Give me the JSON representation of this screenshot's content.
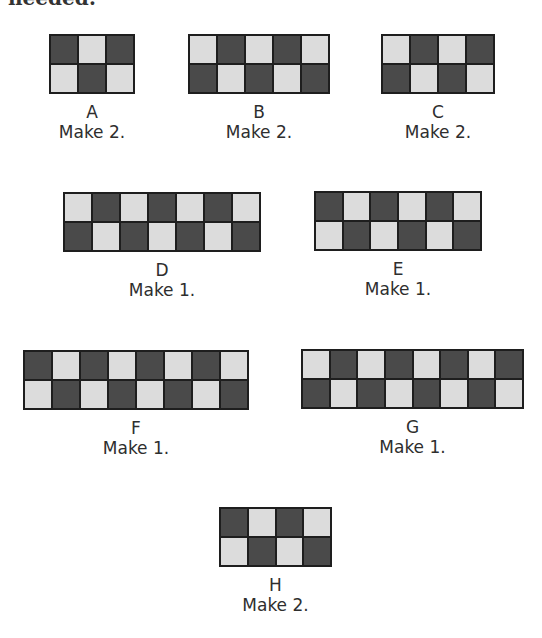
{
  "heading": "needed:",
  "colors": {
    "dark": "#4a4a4a",
    "light": "#dcdcdc",
    "border": "#1e1e1e"
  },
  "units": [
    {
      "letter": "A",
      "instruction": "Make 2.",
      "columns": 3,
      "rows": 2,
      "pattern": [
        [
          "dark",
          "light",
          "dark"
        ],
        [
          "light",
          "dark",
          "light"
        ]
      ],
      "box": {
        "x": 49,
        "y": 34,
        "w": 86,
        "h": 60
      }
    },
    {
      "letter": "B",
      "instruction": "Make 2.",
      "columns": 5,
      "rows": 2,
      "pattern": [
        [
          "light",
          "dark",
          "light",
          "dark",
          "light"
        ],
        [
          "dark",
          "light",
          "dark",
          "light",
          "dark"
        ]
      ],
      "box": {
        "x": 188,
        "y": 34,
        "w": 142,
        "h": 60
      }
    },
    {
      "letter": "C",
      "instruction": "Make 2.",
      "columns": 4,
      "rows": 2,
      "pattern": [
        [
          "light",
          "dark",
          "light",
          "dark"
        ],
        [
          "dark",
          "light",
          "dark",
          "light"
        ]
      ],
      "box": {
        "x": 381,
        "y": 34,
        "w": 114,
        "h": 60
      }
    },
    {
      "letter": "D",
      "instruction": "Make 1.",
      "columns": 7,
      "rows": 2,
      "pattern": [
        [
          "light",
          "dark",
          "light",
          "dark",
          "light",
          "dark",
          "light"
        ],
        [
          "dark",
          "light",
          "dark",
          "light",
          "dark",
          "light",
          "dark"
        ]
      ],
      "box": {
        "x": 63,
        "y": 192,
        "w": 198,
        "h": 60
      }
    },
    {
      "letter": "E",
      "instruction": "Make 1.",
      "columns": 6,
      "rows": 2,
      "pattern": [
        [
          "dark",
          "light",
          "dark",
          "light",
          "dark",
          "light"
        ],
        [
          "light",
          "dark",
          "light",
          "dark",
          "light",
          "dark"
        ]
      ],
      "box": {
        "x": 314,
        "y": 191,
        "w": 168,
        "h": 60
      }
    },
    {
      "letter": "F",
      "instruction": "Make 1.",
      "columns": 8,
      "rows": 2,
      "pattern": [
        [
          "dark",
          "light",
          "dark",
          "light",
          "dark",
          "light",
          "dark",
          "light"
        ],
        [
          "light",
          "dark",
          "light",
          "dark",
          "light",
          "dark",
          "light",
          "dark"
        ]
      ],
      "box": {
        "x": 23,
        "y": 350,
        "w": 226,
        "h": 60
      }
    },
    {
      "letter": "G",
      "instruction": "Make 1.",
      "columns": 8,
      "rows": 2,
      "pattern": [
        [
          "light",
          "dark",
          "light",
          "dark",
          "light",
          "dark",
          "light",
          "dark"
        ],
        [
          "dark",
          "light",
          "dark",
          "light",
          "dark",
          "light",
          "dark",
          "light"
        ]
      ],
      "box": {
        "x": 301,
        "y": 349,
        "w": 223,
        "h": 60
      }
    },
    {
      "letter": "H",
      "instruction": "Make 2.",
      "columns": 4,
      "rows": 2,
      "pattern": [
        [
          "dark",
          "light",
          "dark",
          "light"
        ],
        [
          "light",
          "dark",
          "light",
          "dark"
        ]
      ],
      "box": {
        "x": 219,
        "y": 507,
        "w": 113,
        "h": 60
      }
    }
  ]
}
